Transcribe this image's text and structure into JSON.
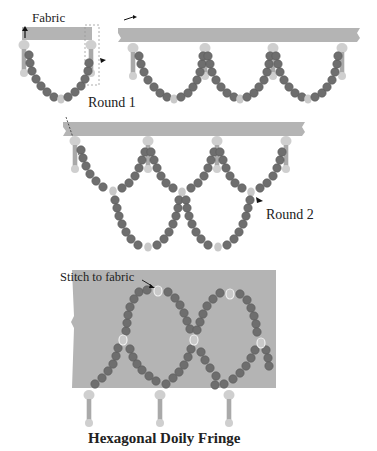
{
  "labels": {
    "fabric": "Fabric",
    "round1": "Round 1",
    "round2": "Round 2",
    "stitch": "Stitch to fabric",
    "title": "Hexagonal Doily Fringe"
  },
  "colors": {
    "fabric": "#b4b4b4",
    "bead_dark": "#6e6e6e",
    "bead_light": "#c9c9c9",
    "dangle": "#bdbdbd",
    "text": "#222222"
  },
  "panels": [
    {
      "name": "step-1-first-loop",
      "label": "Fabric"
    },
    {
      "name": "step-1-round-1",
      "label": "Round 1"
    },
    {
      "name": "step-2-round-2",
      "label": "Round 2"
    },
    {
      "name": "step-3-stitch-to-fabric",
      "label": "Stitch to fabric"
    }
  ]
}
